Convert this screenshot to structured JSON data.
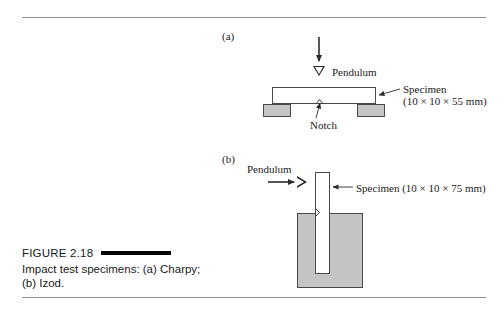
{
  "figure": {
    "panels": [
      {
        "label": "(a)",
        "name": "charpy"
      },
      {
        "label": "(b)",
        "name": "izod"
      }
    ],
    "charpy": {
      "pendulum_label": "Pendulum",
      "notch_label": "Notch",
      "specimen_label": "Specimen",
      "specimen_dimensions": "(10 × 10 × 55 mm)"
    },
    "izod": {
      "pendulum_label": "Pendulum",
      "specimen_label": "Specimen (10 × 10 × 75 mm)"
    }
  },
  "caption": {
    "figure_number": "FIGURE 2.18",
    "text": "Impact test specimens: (a) Charpy; (b) Izod."
  },
  "colors": {
    "block_fill": "#c4c4c4",
    "block_stroke": "#4a4a4a",
    "line": "#3a3a3a",
    "rule": "#8d8d8d",
    "caption_rule": "#000000",
    "text": "#1a1a1a"
  }
}
